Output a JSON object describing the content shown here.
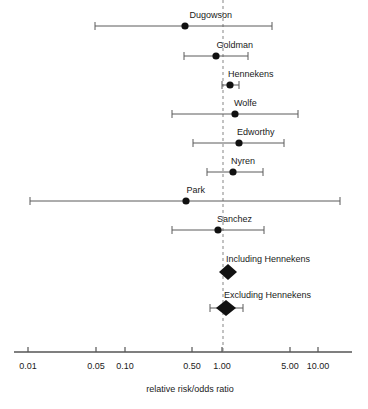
{
  "chart_data": {
    "type": "forest",
    "title": "",
    "xlabel": "relative risk/odds ratio",
    "ylabel": "",
    "xscale": "log",
    "xlim": [
      0.007,
      18.0
    ],
    "grid": false,
    "legend": null,
    "reference_line": {
      "value": 1.0,
      "style": "dashed",
      "color": "#9a9a9a"
    },
    "tick_values": [
      0.01,
      0.05,
      0.1,
      0.5,
      1.0,
      5.0,
      10.0
    ],
    "tick_labels": [
      "0.01",
      "0.05",
      "0.10",
      "0.50",
      "1.00",
      "5.00",
      "10.00"
    ],
    "marker_color": "#111111",
    "line_color": "#5a5a5a",
    "axis_color": "#555555",
    "studies": [
      {
        "label": "Dugowson",
        "marker": "circle",
        "estimate": 0.45,
        "ci_low": 0.046,
        "ci_high": 1.95,
        "x_px": 185,
        "low_px": 95,
        "high_px": 272,
        "y_px": 26,
        "label_anchor": "end",
        "label_x_px": 232,
        "label_y_px": 18
      },
      {
        "label": "Goldman",
        "marker": "circle",
        "estimate": 0.82,
        "ci_low": 0.46,
        "ci_high": 1.47,
        "x_px": 216,
        "low_px": 184,
        "high_px": 248,
        "y_px": 56,
        "label_anchor": "end",
        "label_x_px": 253,
        "label_y_px": 48
      },
      {
        "label": "Hennekens",
        "marker": "circle",
        "estimate": 1.12,
        "ci_low": 1.0,
        "ci_high": 1.27,
        "x_px": 230,
        "low_px": 222,
        "high_px": 239,
        "y_px": 85,
        "label_anchor": "start",
        "label_x_px": 228,
        "label_y_px": 77
      },
      {
        "label": "Wolfe",
        "marker": "circle",
        "estimate": 1.3,
        "ci_low": 0.33,
        "ci_high": 4.95,
        "x_px": 235,
        "low_px": 172,
        "high_px": 298,
        "y_px": 114,
        "label_anchor": "start",
        "label_x_px": 234,
        "label_y_px": 106
      },
      {
        "label": "Edworthy",
        "marker": "circle",
        "estimate": 1.44,
        "ci_low": 0.51,
        "ci_high": 3.8,
        "x_px": 239,
        "low_px": 193,
        "high_px": 284,
        "y_px": 143,
        "label_anchor": "start",
        "label_x_px": 237,
        "label_y_px": 135
      },
      {
        "label": "Nyren",
        "marker": "circle",
        "estimate": 1.2,
        "ci_low": 0.65,
        "ci_high": 2.55,
        "x_px": 233,
        "low_px": 207,
        "high_px": 263,
        "y_px": 172,
        "label_anchor": "start",
        "label_x_px": 231,
        "label_y_px": 164
      },
      {
        "label": "Park",
        "marker": "circle",
        "estimate": 0.46,
        "ci_low": 0.011,
        "ci_high": 14.5,
        "x_px": 186,
        "low_px": 30,
        "high_px": 340,
        "y_px": 201,
        "label_anchor": "end",
        "label_x_px": 205,
        "label_y_px": 193
      },
      {
        "label": "Sanchez",
        "marker": "circle",
        "estimate": 0.88,
        "ci_low": 0.33,
        "ci_high": 2.6,
        "x_px": 218,
        "low_px": 172,
        "high_px": 264,
        "y_px": 230,
        "label_anchor": "end",
        "label_x_px": 252,
        "label_y_px": 222
      }
    ],
    "summaries": [
      {
        "label": "Including Hennekens",
        "marker": "diamond",
        "estimate": 1.1,
        "ci_low": 0.96,
        "ci_high": 1.25,
        "x_px": 228,
        "low_px": 219,
        "high_px": 237,
        "y_px": 272,
        "half_width_px": 9,
        "half_height_px": 8,
        "label_anchor": "start",
        "label_x_px": 226,
        "label_y_px": 262
      },
      {
        "label": "Excluding Hennekens",
        "marker": "diamond",
        "estimate": 1.05,
        "ci_low": 0.7,
        "ci_high": 1.54,
        "x_px": 226,
        "low_px": 210,
        "high_px": 243,
        "y_px": 308,
        "half_width_px": 10,
        "half_height_px": 8,
        "label_anchor": "start",
        "label_x_px": 224,
        "label_y_px": 298
      }
    ],
    "axis": {
      "y_px": 352,
      "x_start_px": 14,
      "x_end_px": 352,
      "tick_px": [
        28,
        96,
        125,
        192,
        222,
        290,
        318
      ],
      "tick_len_px": 5,
      "tick_label_y_px": 369,
      "title_x_px": 190,
      "title_y_px": 392
    },
    "reference_line_px": {
      "x": 223,
      "y_top": 0,
      "y_bottom": 352
    }
  }
}
